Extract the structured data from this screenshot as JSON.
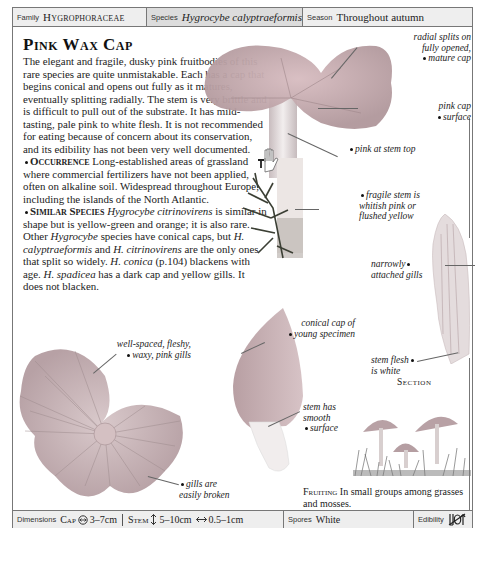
{
  "header": {
    "family_label": "Family",
    "family_value": "Hygrophoraceae",
    "species_label": "Species",
    "species_value": "Hygrocybe calyptraeformis",
    "season_label": "Season",
    "season_value": "Throughout autumn"
  },
  "title": "Pink Wax Cap",
  "description": {
    "intro": "The elegant and fragile, dusky pink fruitbodies of this rare species are quite unmistakable. Each has a cap that begins conical and opens out fully as it matures, eventually splitting radially. The stem is very brittle and is difficult to pull out of the substrate. It has mild-tasting, pale pink to white flesh. It is not recommended for eating because of concern about its conservation, and its edibility has not been very well documented.",
    "occurrence_heading": "Occurrence",
    "occurrence_text": "Long-established areas of grassland where commercial fertilizers have not been applied, often on alkaline soil. Widespread throughout Europe, including the islands of the North Atlantic.",
    "similar_heading": "Similar Species",
    "similar_parts": [
      {
        "t": "Hygrocybe citrinovirens",
        "i": true
      },
      {
        "t": " is similar in shape but is yellow-green and orange; it is also rare. Other ",
        "i": false
      },
      {
        "t": "Hygrocybe",
        "i": true
      },
      {
        "t": " species have conical caps, but ",
        "i": false
      },
      {
        "t": "H. calyptraeformis",
        "i": true
      },
      {
        "t": " and ",
        "i": false
      },
      {
        "t": "H. citrinovirens",
        "i": true
      },
      {
        "t": " are the only ones that split so widely. ",
        "i": false
      },
      {
        "t": "H. conica",
        "i": true
      },
      {
        "t": " (p.104) blackens with age. ",
        "i": false
      },
      {
        "t": "H. spadicea",
        "i": true
      },
      {
        "t": " has a dark cap and yellow gills. It does not blacken.",
        "i": false
      }
    ]
  },
  "annotations": {
    "radial_splits": [
      "radial splits on",
      "fully opened,",
      "mature cap"
    ],
    "pink_cap": [
      "pink cap",
      "surface"
    ],
    "pink_stem_top": [
      "pink at stem top"
    ],
    "fragile_stem": [
      "fragile stem is",
      "whitish pink or",
      "flushed yellow"
    ],
    "narrow_gills": [
      "narrowly",
      "attached gills"
    ],
    "conical_cap": [
      "conical cap of",
      "young specimen"
    ],
    "stem_flesh": [
      "stem flesh",
      "is white"
    ],
    "well_spaced": [
      "well-spaced, fleshy,",
      "waxy, pink gills"
    ],
    "stem_smooth": [
      "stem has",
      "smooth",
      "surface"
    ],
    "gills_broken": [
      "gills are",
      "easily broken"
    ]
  },
  "section_label": "Section",
  "fruiting": {
    "heading": "Fruiting",
    "text": "In small groups among grasses and mosses."
  },
  "icons": {
    "hand": "poison-hand-icon",
    "edibility": "not-edible-icon",
    "cap_diameter": "diameter-icon",
    "stem_height": "height-arrow-icon",
    "stem_width": "width-arrow-icon"
  },
  "footer": {
    "dimensions_label": "Dimensions",
    "cap_label": "Cap",
    "cap_value": "3–7cm",
    "stem_label": "Stem",
    "stem_height": "5–10cm",
    "stem_width": "0.5–1cm",
    "spores_label": "Spores",
    "spores_value": "White",
    "edibility_label": "Edibility"
  },
  "colors": {
    "border": "#777777",
    "header_bg": "#eeeeee",
    "species_bg": "#dcdcdc",
    "mushroom_pink": "#c9a9ad",
    "stem_white": "#eeeae8"
  }
}
